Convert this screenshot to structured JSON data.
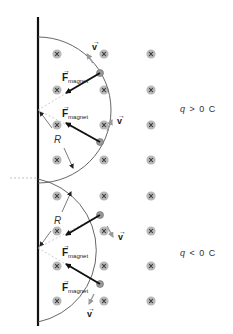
{
  "diagram": {
    "field_symbol": "x",
    "field_direction": "into-page",
    "colors": {
      "field_dot": "#b8b8b8",
      "field_x": "#333333",
      "path": "#555555",
      "force_arrow": "#111111",
      "velocity_arrow": "#9a9a9a",
      "wall": "#111111",
      "dashed": "#aaaaaa"
    },
    "top_panel": {
      "charge_label": {
        "q": "q",
        "rel": ">",
        "value": "0 C"
      },
      "velocity_label": "v",
      "force_label_main": "F",
      "force_label_sub": "magnet",
      "radius_label": "R"
    },
    "bottom_panel": {
      "charge_label": {
        "q": "q",
        "rel": "<",
        "value": "0 C"
      },
      "velocity_label": "v",
      "force_label_main": "F",
      "force_label_sub": "magnet",
      "radius_label": "R"
    },
    "vector_hat": "→"
  }
}
